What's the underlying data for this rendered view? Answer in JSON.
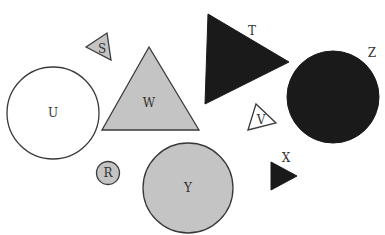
{
  "colors": {
    "background": "#ffffff",
    "gray_fill": "#c4c4c4",
    "black_fill": "#1a1a1a",
    "white_fill": "#ffffff",
    "stroke": "#3a3a3a",
    "label": "#333333"
  },
  "shapes": [
    {
      "id": "S",
      "type": "triangle",
      "fill": "gray",
      "label": "S"
    },
    {
      "id": "T",
      "type": "triangle",
      "fill": "black",
      "label": "T"
    },
    {
      "id": "U",
      "type": "circle",
      "fill": "white",
      "label": "U"
    },
    {
      "id": "W",
      "type": "triangle",
      "fill": "gray",
      "label": "W"
    },
    {
      "id": "Z",
      "type": "circle",
      "fill": "black",
      "label": "Z"
    },
    {
      "id": "V",
      "type": "triangle",
      "fill": "white",
      "label": "V"
    },
    {
      "id": "R",
      "type": "circle",
      "fill": "gray",
      "label": "R"
    },
    {
      "id": "Y",
      "type": "circle",
      "fill": "gray",
      "label": "Y"
    },
    {
      "id": "X",
      "type": "triangle",
      "fill": "black",
      "label": "X"
    }
  ]
}
